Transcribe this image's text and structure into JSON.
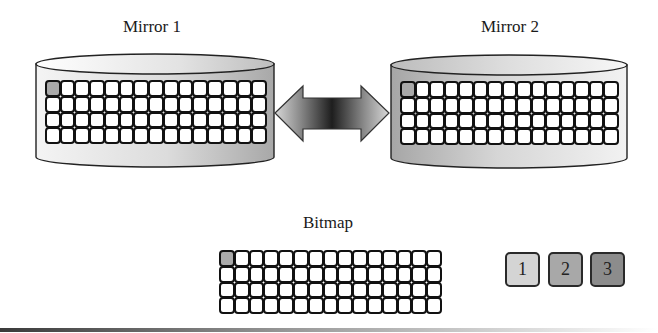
{
  "diagram": {
    "mirror1": {
      "label": "Mirror 1",
      "grid": {
        "rows": 4,
        "cols": 15,
        "shaded_cells": [
          [
            0,
            0
          ]
        ]
      },
      "body_color": "#d8d8d8"
    },
    "mirror2": {
      "label": "Mirror 2",
      "grid": {
        "rows": 4,
        "cols": 15,
        "shaded_cells": [
          [
            0,
            0
          ]
        ]
      },
      "body_color": "#bdbdbd"
    },
    "sync_arrow": {
      "type": "double-headed",
      "direction": "bidirectional",
      "gradient": [
        "#d0d0d0",
        "#1e1e1e",
        "#d0d0d0"
      ]
    },
    "bitmap": {
      "label": "Bitmap",
      "grid": {
        "rows": 4,
        "cols": 15,
        "shaded_cells": [
          [
            0,
            0
          ]
        ]
      }
    },
    "legend": [
      {
        "label": "1",
        "color": "#d4d4d4"
      },
      {
        "label": "2",
        "color": "#a8a8a8"
      },
      {
        "label": "3",
        "color": "#8c8c8c"
      }
    ],
    "cell_shade_color": "#a9a9a9",
    "outline_color": "#111111"
  }
}
